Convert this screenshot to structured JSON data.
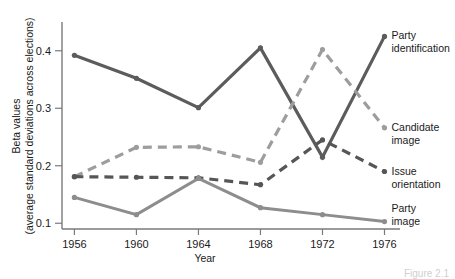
{
  "caption": "Figure 2.1",
  "chart_data": {
    "type": "line",
    "title": "",
    "xlabel": "Year",
    "ylabel": "Beta values (average standard deviations across elections)",
    "ylabel_line1": "Beta values",
    "ylabel_line2": "(average standard deviations across elections)",
    "categories": [
      "1956",
      "1960",
      "1964",
      "1968",
      "1972",
      "1976"
    ],
    "x": [
      1956,
      1960,
      1964,
      1968,
      1972,
      1976
    ],
    "xticklabels": [
      "1956",
      "1960",
      "1964",
      "1968",
      "1972",
      "1976"
    ],
    "yticks": [
      0.1,
      0.2,
      0.3,
      0.4
    ],
    "yticklabels": [
      "0.1",
      "0.2",
      "0.3",
      "0.4"
    ],
    "ylim": [
      0.09,
      0.45
    ],
    "xlim": [
      1955.2,
      1977.0
    ],
    "grid": false,
    "legend": "inline-right-labels",
    "series": [
      {
        "name": "Party identification",
        "label_line1": "Party",
        "label_line2": "identification",
        "values": [
          0.392,
          0.352,
          0.301,
          0.405,
          0.215,
          0.425
        ],
        "color": "#5c5c5c",
        "style": "solid",
        "width": 3.2,
        "markers": true
      },
      {
        "name": "Candidate image",
        "label_line1": "Candidate",
        "label_line2": "image",
        "values": [
          0.181,
          0.232,
          0.233,
          0.206,
          0.402,
          0.266
        ],
        "color": "#9d9d9d",
        "style": "dashed",
        "width": 3.2,
        "markers": true
      },
      {
        "name": "Issue orientation",
        "label_line1": "Issue",
        "label_line2": "orientation",
        "values": [
          0.181,
          0.18,
          0.179,
          0.167,
          0.245,
          0.19
        ],
        "color": "#565656",
        "style": "dashed",
        "width": 3.2,
        "markers": true
      },
      {
        "name": "Party image",
        "label_line1": "Party",
        "label_line2": "image",
        "values": [
          0.145,
          0.115,
          0.178,
          0.127,
          0.115,
          0.103
        ],
        "color": "#8d8d8d",
        "style": "solid",
        "width": 3.0,
        "markers": true
      }
    ]
  }
}
